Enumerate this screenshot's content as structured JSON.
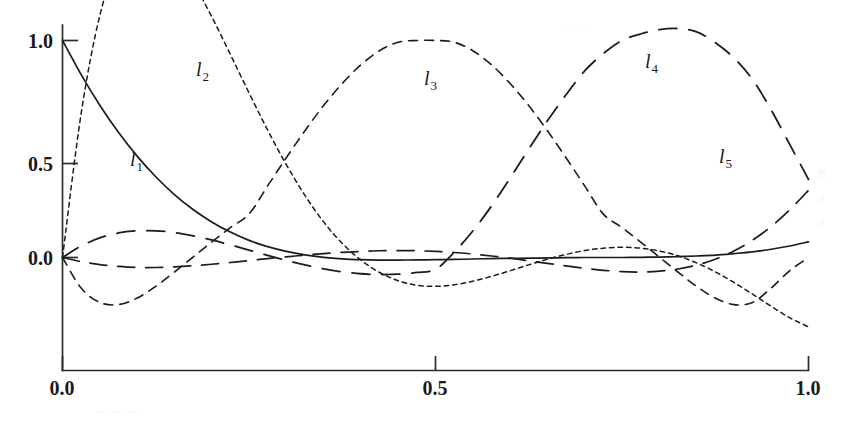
{
  "figure": {
    "name": "lagrange-basis-polynomials",
    "background_color": "#ffffff",
    "ink_color": "#1c1c1c"
  },
  "axes": {
    "x": {
      "ticks": [
        "0.0",
        "0.5",
        "1.0"
      ],
      "tick_values": [
        0.0,
        0.5,
        1.0
      ],
      "range": [
        0.0,
        1.0
      ]
    },
    "y": {
      "ticks": [
        "0.0",
        "0.5",
        "1.0"
      ],
      "tick_values": [
        0.0,
        0.5,
        1.0
      ],
      "range": [
        -0.32,
        1.22
      ]
    }
  },
  "curve_labels": [
    {
      "base": "l",
      "sub": "1"
    },
    {
      "base": "l",
      "sub": "2"
    },
    {
      "base": "l",
      "sub": "3"
    },
    {
      "base": "l",
      "sub": "4"
    },
    {
      "base": "l",
      "sub": "5"
    }
  ],
  "chart_data": {
    "type": "line",
    "title": "",
    "xlabel": "",
    "ylabel": "",
    "xlim": [
      0.0,
      1.0
    ],
    "ylim": [
      -0.32,
      1.22
    ],
    "grid": false,
    "legend": "inline-curve-labels",
    "xticks": [
      0.0,
      0.5,
      1.0
    ],
    "xticklabels": [
      "0.0",
      "0.5",
      "1.0"
    ],
    "yticks": [
      0.0,
      0.5,
      1.0
    ],
    "yticklabels": [
      "0.0",
      "0.5",
      "1.0"
    ],
    "nodes": [
      0.0,
      0.25,
      0.5,
      0.75,
      1.0
    ],
    "x": [
      0.0,
      0.025,
      0.05,
      0.075,
      0.1,
      0.125,
      0.15,
      0.175,
      0.2,
      0.225,
      0.25,
      0.275,
      0.3,
      0.325,
      0.35,
      0.375,
      0.4,
      0.425,
      0.45,
      0.475,
      0.5,
      0.525,
      0.55,
      0.575,
      0.6,
      0.625,
      0.65,
      0.675,
      0.7,
      0.725,
      0.75,
      0.775,
      0.8,
      0.825,
      0.85,
      0.875,
      0.9,
      0.925,
      0.95,
      0.975,
      1.0
    ],
    "series": [
      {
        "name": "l1",
        "label": "l₁",
        "style": "solid",
        "values": [
          1.0,
          0.843,
          0.702,
          0.577,
          0.467,
          0.372,
          0.29,
          0.221,
          0.164,
          0.117,
          0.079,
          0.05,
          0.028,
          0.012,
          0.001,
          -0.006,
          -0.01,
          -0.012,
          -0.012,
          -0.011,
          -0.01,
          -0.009,
          -0.007,
          -0.005,
          -0.004,
          -0.003,
          -0.002,
          -0.001,
          0.0,
          0.0,
          0.0,
          0.001,
          0.002,
          0.004,
          0.007,
          0.011,
          0.018,
          0.026,
          0.038,
          0.053,
          0.072
        ]
      },
      {
        "name": "l2",
        "label": "l₂",
        "style": "dotted",
        "values": [
          0.0,
          0.664,
          1.115,
          1.368,
          1.49,
          1.49,
          1.4,
          1.269,
          1.11,
          0.936,
          0.759,
          0.587,
          0.428,
          0.286,
          0.164,
          0.065,
          -0.012,
          -0.069,
          -0.107,
          -0.128,
          -0.133,
          -0.126,
          -0.109,
          -0.087,
          -0.061,
          -0.034,
          -0.008,
          0.014,
          0.032,
          0.043,
          0.047,
          0.043,
          0.03,
          0.008,
          -0.025,
          -0.066,
          -0.115,
          -0.169,
          -0.225,
          -0.278,
          -0.32
        ]
      },
      {
        "name": "l3",
        "label": "l₃",
        "style": "dashed-medium",
        "values": [
          0.0,
          -0.141,
          -0.207,
          -0.217,
          -0.187,
          -0.133,
          -0.067,
          0.002,
          0.071,
          0.138,
          0.2,
          0.33,
          0.46,
          0.584,
          0.7,
          0.802,
          0.888,
          0.953,
          0.992,
          1.0,
          1.0,
          0.992,
          0.953,
          0.888,
          0.802,
          0.7,
          0.584,
          0.46,
          0.33,
          0.2,
          0.138,
          0.071,
          0.002,
          -0.067,
          -0.133,
          -0.187,
          -0.217,
          -0.207,
          -0.141,
          -0.06,
          0.0
        ]
      },
      {
        "name": "l4",
        "label": "l₄",
        "style": "dashed-long",
        "values": [
          0.0,
          0.053,
          0.09,
          0.113,
          0.123,
          0.123,
          0.115,
          0.1,
          0.081,
          0.058,
          0.034,
          0.01,
          -0.013,
          -0.034,
          -0.052,
          -0.066,
          -0.075,
          -0.079,
          -0.077,
          -0.069,
          -0.055,
          0.024,
          0.122,
          0.237,
          0.366,
          0.5,
          0.63,
          0.75,
          0.86,
          0.94,
          1.0,
          1.03,
          1.05,
          1.055,
          1.04,
          0.99,
          0.92,
          0.82,
          0.68,
          0.52,
          0.36
        ]
      },
      {
        "name": "l5",
        "label": "l₅",
        "style": "dashed-long2",
        "values": [
          0.0,
          -0.019,
          -0.033,
          -0.041,
          -0.046,
          -0.046,
          -0.043,
          -0.038,
          -0.031,
          -0.023,
          -0.014,
          -0.005,
          0.003,
          0.011,
          0.018,
          0.024,
          0.028,
          0.031,
          0.032,
          0.031,
          0.028,
          0.023,
          0.016,
          0.007,
          -0.003,
          -0.015,
          -0.027,
          -0.039,
          -0.05,
          -0.059,
          -0.065,
          -0.067,
          -0.063,
          -0.053,
          -0.035,
          -0.008,
          0.03,
          0.08,
          0.143,
          0.22,
          0.31
        ]
      }
    ]
  }
}
